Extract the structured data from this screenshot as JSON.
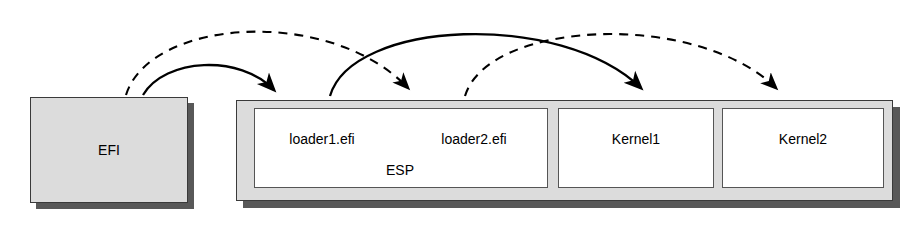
{
  "diagram": {
    "type": "block-flow-diagram",
    "background_color": "#ffffff",
    "blocks": [
      {
        "id": "efi",
        "label": "EFI",
        "role": "firmware",
        "fill": "#dcdcdc",
        "border": "#3a3a3a",
        "shadow": "#585858",
        "x": 30,
        "y": 97,
        "width": 158,
        "height": 106
      },
      {
        "id": "esp-container",
        "label": "",
        "role": "disk-container",
        "fill": "#dcdcdc",
        "border": "#3a3a3a",
        "shadow": "#585858",
        "x": 236,
        "y": 100,
        "width": 657,
        "height": 101
      },
      {
        "id": "esp",
        "label": "ESP",
        "role": "partition",
        "fill": "#ffffff",
        "border": "#555555",
        "x": 254,
        "y": 108,
        "width": 294,
        "height": 80
      },
      {
        "id": "kernel1",
        "label": "Kernel1",
        "role": "partition",
        "fill": "#ffffff",
        "border": "#555555",
        "x": 558,
        "y": 108,
        "width": 156,
        "height": 80
      },
      {
        "id": "kernel2",
        "label": "Kernel2",
        "role": "partition",
        "fill": "#ffffff",
        "border": "#555555",
        "x": 722,
        "y": 108,
        "width": 162,
        "height": 80
      }
    ],
    "labels": {
      "efi": "EFI",
      "loader1": "loader1.efi",
      "loader2": "loader2.efi",
      "esp": "ESP",
      "kernel1": "Kernel1",
      "kernel2": "Kernel2"
    },
    "arrows": [
      {
        "id": "arrow-efi-to-loader1",
        "style": "solid",
        "color": "#000000",
        "from_block": "efi",
        "to_block": "esp",
        "from_label": "EFI",
        "to_label": "loader1.efi",
        "start_x": 143,
        "start_y": 97,
        "end_x": 278,
        "end_y": 100,
        "peak_y": 62
      },
      {
        "id": "arrow-efi-to-loader2",
        "style": "dashed",
        "color": "#000000",
        "from_block": "efi",
        "to_block": "esp",
        "from_label": "EFI",
        "to_label": "loader2.efi",
        "start_x": 126,
        "start_y": 97,
        "end_x": 413,
        "end_y": 100,
        "peak_y": 22
      },
      {
        "id": "arrow-loader1-to-kernel1",
        "style": "solid",
        "color": "#000000",
        "from_block": "esp",
        "to_block": "kernel1",
        "from_label": "loader1.efi",
        "to_label": "Kernel1",
        "start_x": 330,
        "start_y": 100,
        "end_x": 645,
        "end_y": 100,
        "peak_y": 22
      },
      {
        "id": "arrow-loader2-to-kernel2",
        "style": "dashed",
        "color": "#000000",
        "from_block": "esp",
        "to_block": "kernel2",
        "from_label": "loader2.efi",
        "to_label": "Kernel2",
        "start_x": 465,
        "start_y": 100,
        "end_x": 780,
        "end_y": 100,
        "peak_y": 22
      }
    ]
  }
}
